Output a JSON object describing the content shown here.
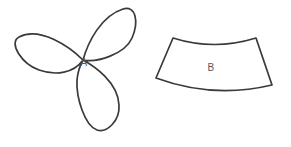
{
  "figure": {
    "background_color": "#ffffff",
    "stroke_color": "#3a3a3c",
    "label_color": "#5a5a5c",
    "stroke_width": 1.7,
    "width": 291,
    "height": 147,
    "shapes": [
      {
        "id": "shape-a",
        "label": "A",
        "kind": "trefoil",
        "description": "three-petal trefoil / clover outline",
        "label_x": 84,
        "label_y": 63,
        "center_x": 83,
        "center_y": 60,
        "petal_tips": [
          {
            "x": 17,
            "y": 38
          },
          {
            "x": 137,
            "y": 12
          },
          {
            "x": 100,
            "y": 131
          }
        ],
        "path": "M 83 60 C 70 47, 40 26, 19 37 C 8 43, 22 64, 39 70 C 56 76, 74 73, 83 60 Z M 83 60 C 88 42, 101 16, 123 9 C 136 5, 139 22, 132 38 C 125 54, 97 63, 83 60 Z M 83 60 C 94 66, 118 82, 119 105 C 120 122, 106 133, 97 130 C 85 126, 76 98, 77 80 C 78 69, 83 60, 83 60 Z"
      },
      {
        "id": "shape-b",
        "label": "B",
        "kind": "annular-sector",
        "description": "curved band / annular sector with concave top and convex bottom",
        "label_x": 211,
        "label_y": 68,
        "corners": [
          {
            "x": 173,
            "y": 38
          },
          {
            "x": 256,
            "y": 38
          },
          {
            "x": 272,
            "y": 85
          },
          {
            "x": 156,
            "y": 78
          }
        ],
        "top_arc_sag": 5,
        "bottom_arc_sag": 7,
        "path": "M 173 38 Q 214 51, 256 38 L 272 85 Q 213 99, 156 78 Z"
      }
    ]
  }
}
